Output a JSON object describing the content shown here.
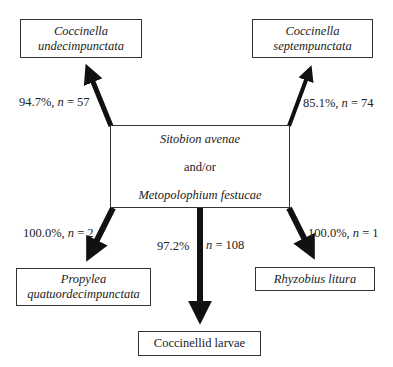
{
  "diagram": {
    "center": {
      "line1": "Sitobion avenae",
      "line2": "and/or",
      "line3": "Metopolophium festucae"
    },
    "nodes": {
      "top_left": {
        "line1": "Coccinella",
        "line2": "undecimpunctata"
      },
      "top_right": {
        "line1": "Coccinella",
        "line2": "septempunctata"
      },
      "bottom_left": {
        "line1": "Propylea",
        "line2": "quatuordecimpunctata"
      },
      "bottom_center": {
        "line1": "Coccinellid larvae"
      },
      "bottom_right": {
        "line1": "Rhyzobius litura"
      }
    },
    "edges": {
      "top_left": {
        "pct": "94.7%, ",
        "n_label": "n",
        "n_value": " = 57"
      },
      "top_right": {
        "pct": "85.1%, ",
        "n_label": "n",
        "n_value": " = 74"
      },
      "bottom_left": {
        "pct": "100.0%, ",
        "n_label": "n",
        "n_value": " = 2"
      },
      "bottom_center": {
        "pct": "97.2%",
        "n_label": "n",
        "n_value": " = 108"
      },
      "bottom_right": {
        "pct": "100.0%, ",
        "n_label": "n",
        "n_value": " = 1"
      }
    },
    "colors": {
      "arrow": "#111111",
      "border": "#333333",
      "text": "#222222"
    }
  }
}
